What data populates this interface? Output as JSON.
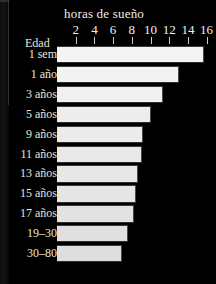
{
  "figure": {
    "title": "horas de sueño",
    "age_axis_label": "Edad"
  },
  "chart_data": {
    "type": "bar",
    "orientation": "horizontal",
    "title": "horas de sueño",
    "xlabel": "horas de sueño",
    "ylabel": "Edad",
    "xlim": [
      0,
      17
    ],
    "xticks": [
      2,
      4,
      6,
      8,
      10,
      12,
      14,
      16
    ],
    "xticklabels": [
      "2",
      "4",
      "6",
      "8",
      "10",
      "12",
      "14",
      "16"
    ],
    "grid": false,
    "legend": null,
    "categories": [
      "1 sem",
      "1 año",
      "3 años",
      "5 años",
      "9 años",
      "11 años",
      "13 años",
      "15 años",
      "17 años",
      "19–30",
      "30–80"
    ],
    "series": [
      {
        "name": "horas de sueño",
        "values": [
          15.7,
          13.0,
          11.3,
          10.1,
          9.2,
          9.1,
          8.7,
          8.5,
          8.2,
          7.6,
          7.0
        ]
      }
    ],
    "bars": [
      {
        "label": "1 sem",
        "value": 15.7
      },
      {
        "label": "1 año",
        "value": 13.0
      },
      {
        "label": "3 años",
        "value": 11.3
      },
      {
        "label": "5 años",
        "value": 10.1
      },
      {
        "label": "9 años",
        "value": 9.2
      },
      {
        "label": "11 años",
        "value": 9.1
      },
      {
        "label": "13 años",
        "value": 8.7
      },
      {
        "label": "15 años",
        "value": 8.5
      },
      {
        "label": "17 años",
        "value": 8.2
      },
      {
        "label": "19–30",
        "value": 7.6
      },
      {
        "label": "30–80",
        "value": 7.0
      }
    ]
  },
  "colors": {
    "background": "#000000",
    "bar_fill": "#f4f3f0",
    "text": "#e9e5dd",
    "tick": "#cfcbc2"
  }
}
